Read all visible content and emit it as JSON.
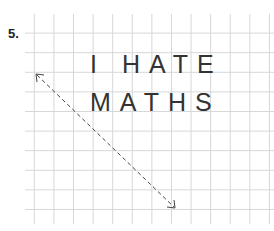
{
  "exercise": {
    "number": "5.",
    "line1": "I HATE",
    "line2": "MATHS"
  },
  "arrow": {
    "type": "dashed-double-arrow",
    "from": [
      35,
      74
    ],
    "to": [
      175,
      208
    ]
  },
  "colors": {
    "grid": "#d6d6d6",
    "text": "#333333"
  }
}
